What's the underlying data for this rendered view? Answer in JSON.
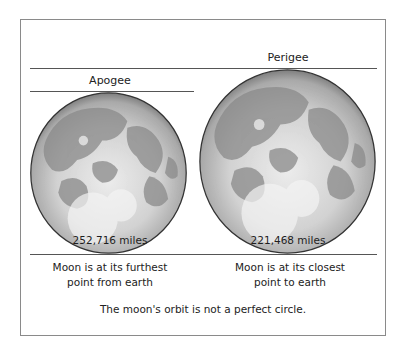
{
  "diagram": {
    "apogee": {
      "label": "Apogee",
      "distance": "252,716 miles",
      "description_line1": "Moon is at its furthest",
      "description_line2": "point from earth"
    },
    "perigee": {
      "label": "Perigee",
      "distance": "221,468 miles",
      "description_line1": "Moon is at its closest",
      "description_line2": "point to earth"
    },
    "caption": "The moon's orbit is not a perfect circle.",
    "colors": {
      "frame": "#8a8a8a",
      "line": "#555555",
      "text": "#222222",
      "moon_light": "#e6e6e6",
      "moon_mid": "#b4b4b4",
      "moon_dark": "#7a7a7a",
      "moon_rim": "#333333"
    }
  }
}
